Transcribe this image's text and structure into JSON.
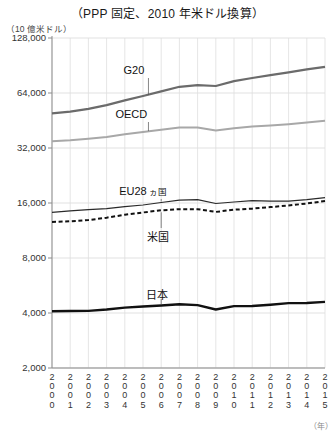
{
  "chart_data": {
    "type": "line",
    "title": "（PPP 固定、2010 年米ドル換算）",
    "ylabel": "（10 億米ドル）",
    "xlabel": "（年）",
    "yscale": "log",
    "ylim": [
      2000,
      128000
    ],
    "yticks": [
      2000,
      4000,
      8000,
      16000,
      32000,
      64000,
      128000
    ],
    "ytick_labels": [
      "2,000",
      "4,000",
      "8,000",
      "16,000",
      "32,000",
      "64,000",
      "128,000"
    ],
    "grid": true,
    "legend": "inline-labels",
    "x": [
      2000,
      2001,
      2002,
      2003,
      2004,
      2005,
      2006,
      2007,
      2008,
      2009,
      2010,
      2011,
      2012,
      2013,
      2014,
      2015
    ],
    "xtick_labels": [
      "2000",
      "2001",
      "2002",
      "2003",
      "2004",
      "2005",
      "2006",
      "2007",
      "2008",
      "2009",
      "2010",
      "2011",
      "2012",
      "2013",
      "2014",
      "2015"
    ],
    "series": [
      {
        "name": "G20",
        "style": "solid-thick",
        "color": "#6b6b6b",
        "values": [
          49500,
          50600,
          52400,
          54900,
          58300,
          61600,
          65300,
          69200,
          70700,
          69900,
          74300,
          77300,
          80100,
          83000,
          86100,
          89000
        ]
      },
      {
        "name": "OECD",
        "style": "solid-medium",
        "color": "#a8a8a8",
        "values": [
          34800,
          35300,
          36000,
          36800,
          38000,
          39100,
          40300,
          41400,
          41400,
          39900,
          41100,
          41900,
          42500,
          43200,
          44100,
          45100
        ]
      },
      {
        "name": "EU28 ヵ国",
        "style": "solid-thin",
        "color": "#2a2a2a",
        "values": [
          14200,
          14500,
          14700,
          14900,
          15300,
          15600,
          16100,
          16600,
          16700,
          15900,
          16200,
          16500,
          16400,
          16400,
          16700,
          17100
        ]
      },
      {
        "name": "米国",
        "style": "dashed",
        "color": "#111111",
        "values": [
          12600,
          12700,
          12900,
          13300,
          13800,
          14200,
          14600,
          14800,
          14800,
          14300,
          14700,
          14900,
          15200,
          15500,
          15900,
          16400
        ]
      },
      {
        "name": "日本",
        "style": "solid-bold",
        "color": "#111111",
        "values": [
          4090,
          4100,
          4110,
          4180,
          4280,
          4340,
          4400,
          4470,
          4420,
          4180,
          4360,
          4370,
          4440,
          4530,
          4540,
          4600
        ]
      }
    ],
    "annotations": [
      {
        "text": "G20",
        "series": "G20",
        "at_x": 2005
      },
      {
        "text": "OECD",
        "series": "OECD",
        "at_x": 2005
      },
      {
        "text": "EU28 ヵ国",
        "series": "EU28 ヵ国",
        "at_x": 2006
      },
      {
        "text": "米国",
        "series": "米国",
        "at_x": 2006
      },
      {
        "text": "日本",
        "series": "日本",
        "at_x": 2006
      }
    ]
  },
  "labels": {
    "g20": "G20",
    "oecd": "OECD",
    "eu28_main": "EU28",
    "eu28_small": " ヵ国",
    "usa": "米国",
    "japan": "日本"
  }
}
